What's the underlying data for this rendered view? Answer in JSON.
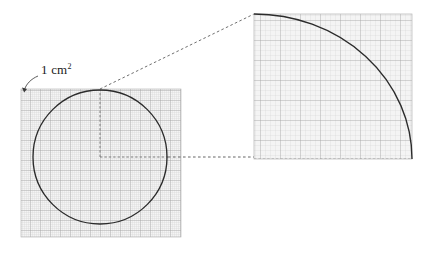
{
  "figure": {
    "unit_label": {
      "text": "1 cm",
      "exponent": "2",
      "full": "1 cm²"
    },
    "colors": {
      "curve": "#2b2b2b",
      "grid_minor": "#c9c9c9",
      "grid_major": "#9a9a9a",
      "grid_fill": "#f4f4f4",
      "panel_border": "#b4b4b4",
      "dashed_connector": "#555555",
      "radius_dash": "#6b6b6b",
      "label_text": "#1a1a1a",
      "background": "#ffffff"
    },
    "left_panel": {
      "name": "circle-on-grid",
      "grid": {
        "x": 21,
        "y": 89,
        "width": 160,
        "height": 148,
        "minor_step": 2,
        "major_step": 10
      },
      "circle": {
        "center_x": 100,
        "center_y": 157,
        "radius": 67
      },
      "radius_lines": [
        {
          "name": "vertical-radius",
          "x1": 100,
          "y1": 157,
          "x2": 100,
          "y2": 90
        },
        {
          "name": "horizontal-radius",
          "x1": 100,
          "y1": 157,
          "x2": 167,
          "y2": 157
        }
      ]
    },
    "magnified_panel": {
      "name": "magnified-quadrant",
      "grid": {
        "x": 254,
        "y": 14,
        "width": 158,
        "height": 145,
        "minor_step": 5,
        "major_step": 20
      },
      "arc": {
        "center_x": 254,
        "center_y": 159,
        "radius_x": 158,
        "radius_y": 145,
        "start_x": 254,
        "start_y": 14,
        "end_x": 412,
        "end_y": 159
      }
    },
    "connectors": [
      {
        "name": "upper-connector",
        "x1": 100,
        "y1": 89,
        "x2": 254,
        "y2": 14
      },
      {
        "name": "lower-connector",
        "x1": 168,
        "y1": 157,
        "x2": 254,
        "y2": 157
      }
    ],
    "callout": {
      "name": "unit-cell-callout",
      "label_x": 41,
      "label_y": 63,
      "arrow_from_x": 38,
      "arrow_from_y": 76,
      "arrow_to_x": 24,
      "arrow_to_y": 92
    }
  }
}
